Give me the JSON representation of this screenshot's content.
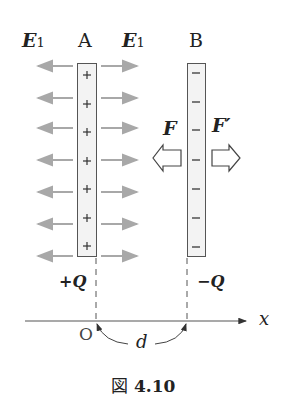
{
  "figure": {
    "caption_prefix": "図",
    "caption_number": "4.10",
    "plates": [
      {
        "name": "A",
        "charge_sign": "+",
        "charge_label": "+Q",
        "charge_count": 7
      },
      {
        "name": "B",
        "charge_sign": "−",
        "charge_label": "−Q",
        "charge_count": 7
      }
    ],
    "field_labels": {
      "left": "E",
      "right": "E",
      "subscript": "1"
    },
    "forces": {
      "left": "F",
      "right": "F′"
    },
    "axis": {
      "origin": "O",
      "variable": "x",
      "separation": "d"
    },
    "colors": {
      "field_arrow": "#a8a8a8",
      "plate_fill": "#f3f3f3",
      "ink": "#222222"
    }
  }
}
